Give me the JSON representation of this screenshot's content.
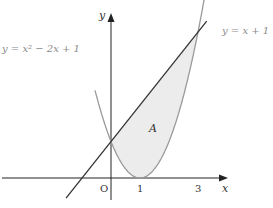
{
  "figure": {
    "curve_label": "y = x² − 2x + 1",
    "line_label": "y = x + 1",
    "region_label": "A",
    "x_axis_label": "x",
    "y_axis_label": "y",
    "origin_label": "O",
    "x_ticks": [
      "1",
      "3"
    ],
    "colors": {
      "curve": "#9a9a9a",
      "line": "#333333",
      "axes": "#222222",
      "region_fill": "#ececec"
    }
  },
  "chart_data": {
    "type": "line",
    "title": "",
    "xlabel": "x",
    "ylabel": "y",
    "series": [
      {
        "name": "y = x² − 2x + 1",
        "expression": "x^2 - 2x + 1"
      },
      {
        "name": "y = x + 1",
        "expression": "x + 1"
      }
    ],
    "shaded_region": {
      "label": "A",
      "between": [
        "y = x + 1",
        "y = x² − 2x + 1"
      ],
      "x_range": [
        0,
        3
      ]
    },
    "intersections": [
      [
        0,
        1
      ],
      [
        3,
        4
      ]
    ],
    "x_tick_labels": [
      "O",
      "1",
      "3"
    ],
    "xlim": [
      -1.3,
      4.3
    ],
    "ylim": [
      -0.6,
      4.8
    ]
  }
}
